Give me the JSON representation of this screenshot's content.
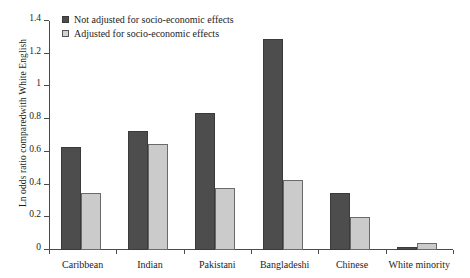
{
  "chart_data": {
    "type": "bar",
    "title": "",
    "xlabel": "",
    "ylabel": "Ln odds ratio comparedwith White English",
    "ylim": [
      0,
      1.4
    ],
    "ytick_labels": [
      "0",
      "0.2",
      "0.4",
      "0.6",
      "0.8",
      "1",
      "1.2",
      "1.4"
    ],
    "ytick_values": [
      0,
      0.2,
      0.4,
      0.6,
      0.8,
      1.0,
      1.2,
      1.4
    ],
    "grid": false,
    "legend_position": "top-left",
    "categories": [
      "Caribbean",
      "Indian",
      "Pakistani",
      "Bangladeshi",
      "Chinese",
      "White minority"
    ],
    "series": [
      {
        "name": "Not adjusted for socio-economic effects",
        "color": "#4d4d4d",
        "values": [
          0.63,
          0.73,
          0.84,
          1.29,
          0.35,
          0.02
        ]
      },
      {
        "name": "Adjusted for socio-economic effects",
        "color": "#cbcbcb",
        "values": [
          0.35,
          0.65,
          0.38,
          0.43,
          0.2,
          0.04
        ]
      }
    ]
  }
}
